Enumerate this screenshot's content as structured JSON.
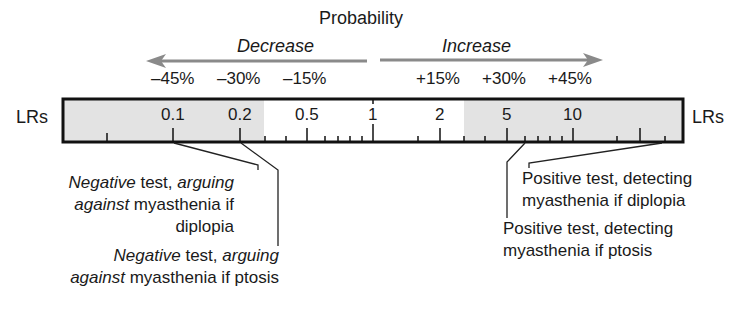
{
  "title": "Probability",
  "arrows": {
    "decrease_label": "Decrease",
    "increase_label": "Increase"
  },
  "percent_labels": {
    "negative": [
      "–45%",
      "–30%",
      "–15%"
    ],
    "positive": [
      "+15%",
      "+30%",
      "+45%"
    ]
  },
  "scale": {
    "left_label": "LRs",
    "right_label": "LRs",
    "tick_labels": [
      "0.1",
      "0.2",
      "0.5",
      "1",
      "2",
      "5",
      "10"
    ],
    "shaded_color": "#e3e3e3",
    "white_zone": [
      0.2,
      2
    ]
  },
  "annotations": {
    "neg_diplopia": {
      "line1_italic_a": "Negative",
      "line1_plain": " test, ",
      "line1_italic_b": "arguing",
      "line2_italic": "against",
      "line2_plain": " myasthenia if",
      "line3": "diplopia",
      "points_to_lr": "0.1"
    },
    "neg_ptosis": {
      "line1_italic_a": "Negative",
      "line1_plain": " test, ",
      "line1_italic_b": "arguing",
      "line2_italic": "against",
      "line2_plain": " myasthenia if ptosis",
      "points_to_lr": "0.2"
    },
    "pos_diplopia": {
      "line1": "Positive test, detecting",
      "line2": "myasthenia if diplopia",
      "points_to_lr": "~30"
    },
    "pos_ptosis": {
      "line1": "Positive test, detecting",
      "line2": "myasthenia if ptosis",
      "points_to_lr": "~8"
    }
  }
}
